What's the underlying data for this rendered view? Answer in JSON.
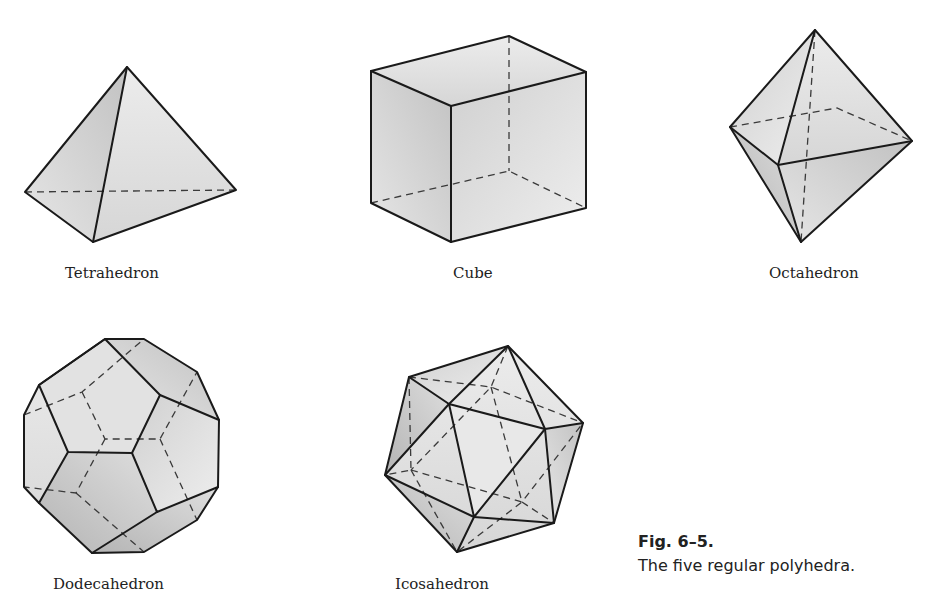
{
  "figure": {
    "number": "Fig. 6–5.",
    "caption": "The five regular polyhedra.",
    "items": [
      {
        "name": "Tetrahedron"
      },
      {
        "name": "Cube"
      },
      {
        "name": "Octahedron"
      },
      {
        "name": "Dodecahedron"
      },
      {
        "name": "Icosahedron"
      }
    ]
  },
  "colors": {
    "edge": "#1a1a1a",
    "face_light": "#efefef",
    "face_dark": "#bdbdbd"
  }
}
